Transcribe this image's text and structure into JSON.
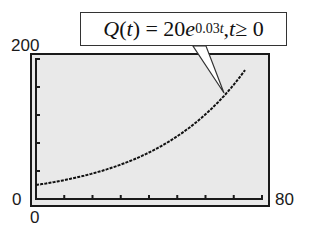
{
  "chart_data": {
    "type": "line",
    "function": "Q(t) = 20*exp(0.03*t)",
    "xlabel": "",
    "ylabel": "",
    "xlim": [
      0,
      80
    ],
    "ylim": [
      0,
      200
    ],
    "x_ticks_every": 10,
    "y_ticks_every": 40,
    "x_tick_labels": {
      "min": "0",
      "max": "80"
    },
    "y_tick_labels": {
      "min": "0",
      "max": "200"
    },
    "grid": false,
    "series": [
      {
        "name": "Q(t)",
        "x": [
          0,
          10,
          20,
          30,
          40,
          50,
          60,
          70,
          74
        ],
        "y": [
          20,
          27,
          36.4,
          49.2,
          66.4,
          89.6,
          121,
          163.3,
          185.3
        ]
      }
    ],
    "annotations": [
      {
        "text": "Q(t) = 20e^{0.03t}, t ≥ 0",
        "points_to": {
          "x": 62,
          "y": 128
        }
      }
    ]
  },
  "labels": {
    "ymax": "200",
    "ymin": "0",
    "xmin": "0",
    "xmax": "80"
  },
  "callout": {
    "q": "Q",
    "t1": "t",
    "eq": ") = 20",
    "e": "e",
    "exp_num": "0.03",
    "exp_t": "t",
    "comma": ", ",
    "t2": "t",
    "cond": " ≥ 0"
  },
  "colors": {
    "plot_bg": "#e9e9e9",
    "frame": "#1a1a1a",
    "curve": "#111111"
  }
}
